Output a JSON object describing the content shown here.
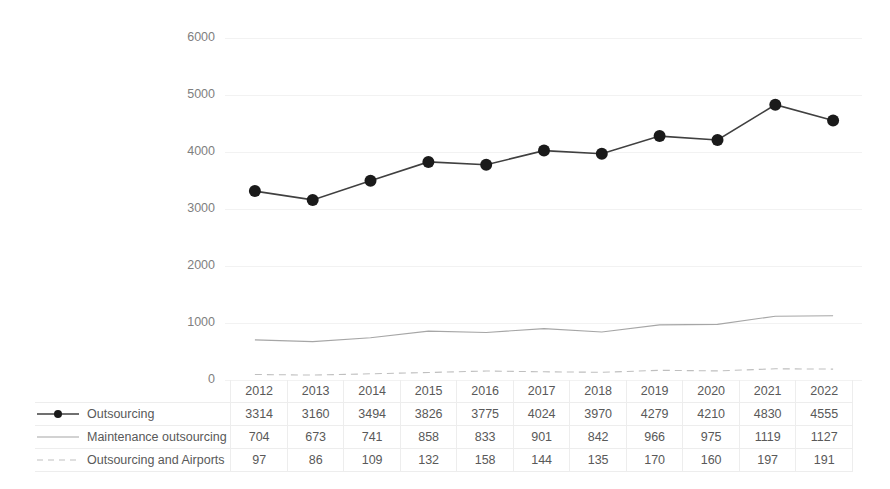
{
  "chart_data": {
    "type": "line",
    "title": "",
    "subtitle": "",
    "xlabel": "",
    "ylabel": "",
    "categories": [
      "2012",
      "2013",
      "2014",
      "2015",
      "2016",
      "2017",
      "2018",
      "2019",
      "2020",
      "2021",
      "2022"
    ],
    "ylim": [
      0,
      6000
    ],
    "yticks": [
      "0",
      "1000",
      "2000",
      "3000",
      "4000",
      "5000",
      "6000"
    ],
    "grid": true,
    "legend_position": "data-table-left",
    "series": [
      {
        "name": "Outsourcing",
        "style": "solid-with-markers",
        "color": "#404040",
        "marker": "filled-circle",
        "values": [
          3314,
          3160,
          3494,
          3826,
          3775,
          4024,
          3970,
          4279,
          4210,
          4830,
          4555
        ]
      },
      {
        "name": "Maintenance outsourcing",
        "style": "solid-thin",
        "color": "#a6a6a6",
        "marker": "none",
        "values": [
          704,
          673,
          741,
          858,
          833,
          901,
          842,
          966,
          975,
          1119,
          1127
        ]
      },
      {
        "name": "Outsourcing and Airports",
        "style": "dashed",
        "color": "#bfbfbf",
        "marker": "none",
        "values": [
          97,
          86,
          109,
          132,
          158,
          144,
          135,
          170,
          160,
          197,
          191
        ]
      }
    ]
  },
  "table": {
    "header": [
      "2012",
      "2013",
      "2014",
      "2015",
      "2016",
      "2017",
      "2018",
      "2019",
      "2020",
      "2021",
      "2022"
    ],
    "rows": [
      {
        "label": "Outsourcing",
        "values": [
          "3314",
          "3160",
          "3494",
          "3826",
          "3775",
          "4024",
          "3970",
          "4279",
          "4210",
          "4830",
          "4555"
        ]
      },
      {
        "label": "Maintenance outsourcing",
        "values": [
          "704",
          "673",
          "741",
          "858",
          "833",
          "901",
          "842",
          "966",
          "975",
          "1119",
          "1127"
        ]
      },
      {
        "label": "Outsourcing and Airports",
        "values": [
          "97",
          "86",
          "109",
          "132",
          "158",
          "144",
          "135",
          "170",
          "160",
          "197",
          "191"
        ]
      }
    ]
  },
  "axis": {
    "y_labels": [
      "6000",
      "5000",
      "4000",
      "3000",
      "2000",
      "1000",
      "0"
    ]
  },
  "colors": {
    "series1": "#404040",
    "series2": "#a6a6a6",
    "series3": "#bfbfbf",
    "grid": "#f2f2f2",
    "text": "#595959",
    "axis_text": "#7f7f7f"
  }
}
